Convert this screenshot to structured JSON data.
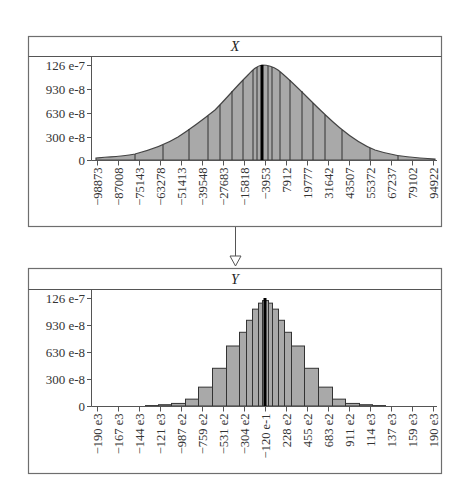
{
  "chart_data": [
    {
      "type": "area",
      "title": "X",
      "description": "Smooth bell-shaped density curve with vertical partition lines",
      "ylabel": "",
      "xlabel": "",
      "y_ticks": [
        "126 e-7",
        "930 e-8",
        "630 e-8",
        "300 e-8",
        "0"
      ],
      "y_tick_values": [
        1.26e-05,
        9.3e-06,
        6.3e-06,
        3e-06,
        0
      ],
      "x_ticks": [
        "-98873",
        "-87008",
        "-75143",
        "-63278",
        "-51413",
        "-39548",
        "-27683",
        "-15818",
        "-3953",
        "7912",
        "19777",
        "31642",
        "43507",
        "55372",
        "67237",
        "79102",
        "94922"
      ],
      "peak_value": 1.26e-05,
      "peak_x": -3953,
      "ylim": [
        0,
        1.26e-05
      ]
    },
    {
      "type": "bar",
      "title": "Y",
      "description": "Histogram, narrower bell-shaped distribution",
      "ylabel": "",
      "xlabel": "",
      "y_ticks": [
        "126 e-7",
        "930 e-8",
        "630 e-8",
        "300 e-8",
        "0"
      ],
      "y_tick_values": [
        1.26e-05,
        9.3e-06,
        6.3e-06,
        3e-06,
        0
      ],
      "x_ticks": [
        "-190 e3",
        "-167 e3",
        "-144 e3",
        "-121 e3",
        "-987 e2",
        "-759 e2",
        "-531 e2",
        "-304 e2",
        "-120 e-1",
        "228 e2",
        "455 e2",
        "683 e2",
        "911 e2",
        "114 e3",
        "137 e3",
        "159 e3",
        "190 e3"
      ],
      "bar_heights_approx": [
        5e-08,
        1.5e-07,
        3e-07,
        8e-07,
        2.2e-06,
        4.4e-06,
        7e-06,
        8.6e-06,
        1e-05,
        1.13e-05,
        1.2e-05,
        1.23e-05,
        1.23e-05,
        1.2e-05,
        1.13e-05,
        1e-05,
        8.6e-06,
        7e-06,
        4.4e-06,
        2.2e-06,
        8e-07,
        3e-07,
        1.5e-07,
        5e-08
      ],
      "ylim": [
        0,
        1.26e-05
      ]
    }
  ],
  "panels": {
    "top": {
      "title": "X"
    },
    "bottom": {
      "title": "Y"
    }
  },
  "connector": {
    "type": "down-arrow"
  }
}
